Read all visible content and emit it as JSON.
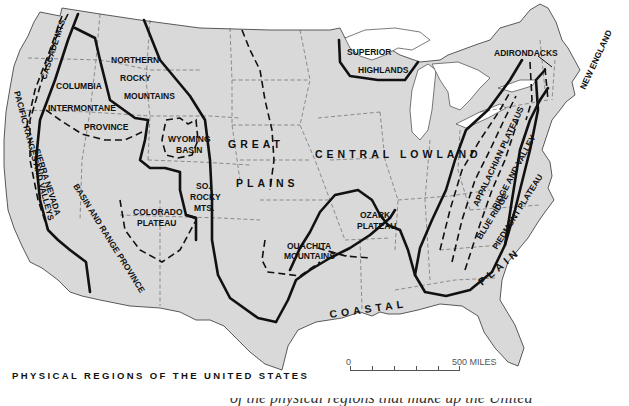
{
  "map": {
    "title": "PHYSICAL REGIONS OF THE UNITED STATES",
    "colors": {
      "land": "#d9d9d9",
      "water": "#ffffff",
      "boundary_major": "#111111",
      "state_lines": "#555555"
    },
    "regions": [
      {
        "id": "pacific",
        "label": "PACIFIC RANGES AND VALLEYS"
      },
      {
        "id": "cascade",
        "label": "CASCADE MTS."
      },
      {
        "id": "sierra",
        "label": "SIERRA NEVADA"
      },
      {
        "id": "columbia1",
        "label": "COLUMBIA"
      },
      {
        "id": "columbia2",
        "label": "INTERMONTANE"
      },
      {
        "id": "columbia3",
        "label": "PROVINCE"
      },
      {
        "id": "nrocky1",
        "label": "NORTHERN"
      },
      {
        "id": "nrocky2",
        "label": "ROCKY"
      },
      {
        "id": "nrocky3",
        "label": "MOUNTAINS"
      },
      {
        "id": "wyoming1",
        "label": "WYOMING"
      },
      {
        "id": "wyoming2",
        "label": "BASIN"
      },
      {
        "id": "basin",
        "label": "BASIN AND RANGE PROVINCE"
      },
      {
        "id": "colorado1",
        "label": "COLORADO"
      },
      {
        "id": "colorado2",
        "label": "PLATEAU"
      },
      {
        "id": "srocky1",
        "label": "SO."
      },
      {
        "id": "srocky2",
        "label": "ROCKY"
      },
      {
        "id": "srocky3",
        "label": "MTS."
      },
      {
        "id": "great1",
        "label": "GREAT"
      },
      {
        "id": "great2",
        "label": "PLAINS"
      },
      {
        "id": "superior1",
        "label": "SUPERIOR"
      },
      {
        "id": "superior2",
        "label": "HIGHLANDS"
      },
      {
        "id": "central",
        "label": "CENTRAL LOWLAND"
      },
      {
        "id": "ozark1",
        "label": "OZARK"
      },
      {
        "id": "ozark2",
        "label": "PLATEAU"
      },
      {
        "id": "ouachita1",
        "label": "OUACHITA"
      },
      {
        "id": "ouachita2",
        "label": "MOUNTAINS"
      },
      {
        "id": "adirondacks",
        "label": "ADIRONDACKS"
      },
      {
        "id": "newengland",
        "label": "NEW ENGLAND"
      },
      {
        "id": "appalachian",
        "label": "APPALACHIAN PLATEAUS"
      },
      {
        "id": "ridge",
        "label": "RIDGE AND VALLEY"
      },
      {
        "id": "blueridge",
        "label": "BLUE RIDGE"
      },
      {
        "id": "piedmont",
        "label": "PIEDMONT PLATEAU"
      },
      {
        "id": "coastal1",
        "label": "COASTAL"
      },
      {
        "id": "coastal2",
        "label": "PLAIN"
      }
    ],
    "scale": {
      "start": "0",
      "end": "500 MILES",
      "ticks": 5
    },
    "caption_cutoff": "of the physical regions that make up the United"
  }
}
